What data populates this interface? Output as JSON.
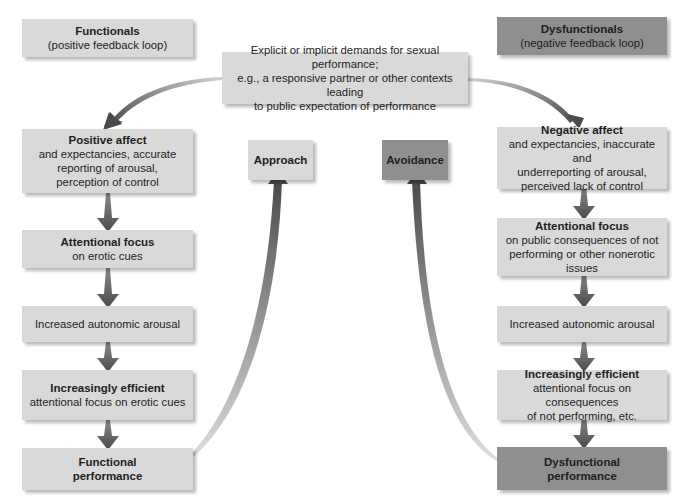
{
  "diagram": {
    "top_center": {
      "lines": [
        "Explicit or implicit demands for sexual performance;",
        "e.g., a responsive partner or other contexts leading",
        "to public expectation of performance"
      ]
    },
    "left_column": {
      "header": {
        "title": "Functionals",
        "subtitle": "(positive feedback loop)"
      },
      "steps": [
        {
          "title": "Positive affect",
          "lines": [
            "and expectancies, accurate",
            "reporting of arousal,",
            "perception of control"
          ]
        },
        {
          "title": "Attentional focus",
          "lines": [
            "on erotic cues"
          ]
        },
        {
          "title": "",
          "lines": [
            "Increased autonomic arousal"
          ]
        },
        {
          "title": "Increasingly efficient",
          "lines": [
            "attentional focus on erotic cues"
          ]
        },
        {
          "title": "Functional",
          "title2": "performance",
          "lines": []
        }
      ]
    },
    "right_column": {
      "header": {
        "title": "Dysfunctionals",
        "subtitle": "(negative feedback loop)"
      },
      "steps": [
        {
          "title": "Negative affect",
          "lines": [
            "and expectancies, inaccurate and",
            "underreporting of arousal,",
            "perceived lack of control"
          ]
        },
        {
          "title": "Attentional focus",
          "lines": [
            "on public consequences of not",
            "performing or other nonerotic",
            "issues"
          ]
        },
        {
          "title": "",
          "lines": [
            "Increased autonomic arousal"
          ]
        },
        {
          "title": "Increasingly efficient",
          "lines": [
            "attentional focus on consequences",
            "of not performing, etc."
          ]
        },
        {
          "title": "Dysfunctional",
          "title2": "performance",
          "lines": []
        }
      ]
    },
    "outcomes": {
      "approach": "Approach",
      "avoidance": "Avoidance"
    },
    "colors": {
      "light_box": "#d9d9d9",
      "dark_box": "#8f8f8f",
      "arrow": "#5a5a5a"
    }
  }
}
